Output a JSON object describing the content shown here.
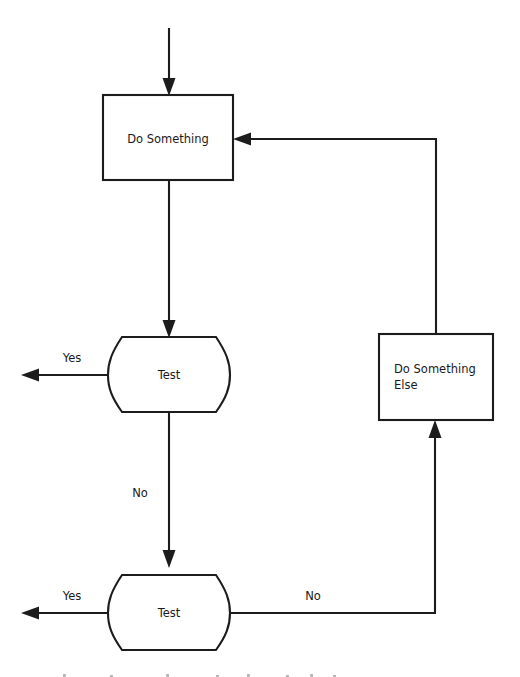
{
  "diagram": {
    "type": "flowchart",
    "title": "",
    "background_color": "#ffffff",
    "line_color": "#1c1c1c",
    "text_color": "#1a1a1a",
    "nodes": [
      {
        "id": "do-something",
        "label": "Do Something",
        "shape": "rectangle",
        "text_align": "center"
      },
      {
        "id": "test-1",
        "label": "Test",
        "shape": "barrel",
        "text_align": "center"
      },
      {
        "id": "do-something-else",
        "label": "Do Something Else",
        "label_line_1": "Do Something",
        "label_line_2": "Else",
        "shape": "rectangle",
        "text_align": "left"
      },
      {
        "id": "test-2",
        "label": "Test",
        "shape": "barrel",
        "text_align": "center"
      }
    ],
    "edges": [
      {
        "id": "entry",
        "label": "",
        "from": "start",
        "to": "do-something"
      },
      {
        "id": "do-something-to-test-1",
        "label": "",
        "from": "do-something",
        "to": "test-1"
      },
      {
        "id": "test-1-yes",
        "label": "Yes",
        "from": "test-1",
        "to": "exit-1"
      },
      {
        "id": "test-1-no",
        "label": "No",
        "from": "test-1",
        "to": "test-2"
      },
      {
        "id": "test-2-yes",
        "label": "Yes",
        "from": "test-2",
        "to": "exit-2"
      },
      {
        "id": "test-2-no",
        "label": "No",
        "from": "test-2",
        "to": "do-something-else"
      },
      {
        "id": "do-something-else-loop",
        "label": "",
        "from": "do-something-else",
        "to": "do-something"
      }
    ],
    "labels": {
      "test1_yes": "Yes",
      "test1_no": "No",
      "test2_yes": "Yes",
      "test2_no": "No"
    }
  }
}
